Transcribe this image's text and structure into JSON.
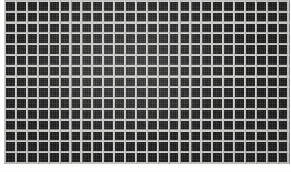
{
  "image": {
    "subject": "dark metal mesh grid panel",
    "description": "Close-up photograph of a dark square-weave wire mesh screen filling the frame, with light gray wires forming a regular grid over near-black cells.",
    "domain": "Natural-Image",
    "width": 291,
    "height": 172
  },
  "grid": {
    "columns": 26,
    "rows": 15,
    "cell_pitch_px": 10.9,
    "wire_width_px": 2,
    "orientation": "orthogonal square weave"
  },
  "colors": {
    "wire_light": "#d6d6d2",
    "wire_mid": "#c4c4c0",
    "wire_shadow": "#a8a8a4",
    "cell_dark": "#242424",
    "cell_darkest": "#1a1a1a",
    "cell_highlight": "#353535",
    "page_background": "#ffffff"
  },
  "layout": {
    "panel_left_px": 4,
    "panel_top_px": 0,
    "panel_width_px": 287,
    "panel_height_px": 164,
    "margin_left_px": 4,
    "margin_bottom_px": 8
  }
}
